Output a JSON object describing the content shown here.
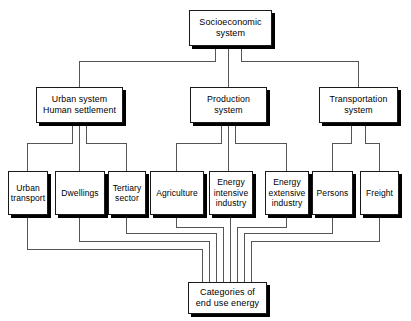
{
  "diagram": {
    "background_color": "#ffffff",
    "line_color": "#555555",
    "box_border_color": "#1a1a1a",
    "box_fill_color": "#ffffff",
    "shadow_color": "#000000",
    "nodes": {
      "root": {
        "label": "Socioeconomic\nsystem"
      },
      "urban_system": {
        "label": "Urban system\nHuman settlement"
      },
      "production_system": {
        "label": "Production\nsystem"
      },
      "transportation_system": {
        "label": "Transportation\nsystem"
      },
      "urban_transport": {
        "label": "Urban\ntransport"
      },
      "dwellings": {
        "label": "Dwellings"
      },
      "tertiary_sector": {
        "label": "Tertiary\nsector"
      },
      "agriculture": {
        "label": "Agriculture"
      },
      "energy_intensive_industry": {
        "label": "Energy\nintensive\nindustry"
      },
      "energy_extensive_industry": {
        "label": "Energy\nextensive\nindustry"
      },
      "persons": {
        "label": "Persons"
      },
      "freight": {
        "label": "Freight"
      },
      "sink": {
        "label": "Categories of\nend use energy"
      }
    }
  }
}
